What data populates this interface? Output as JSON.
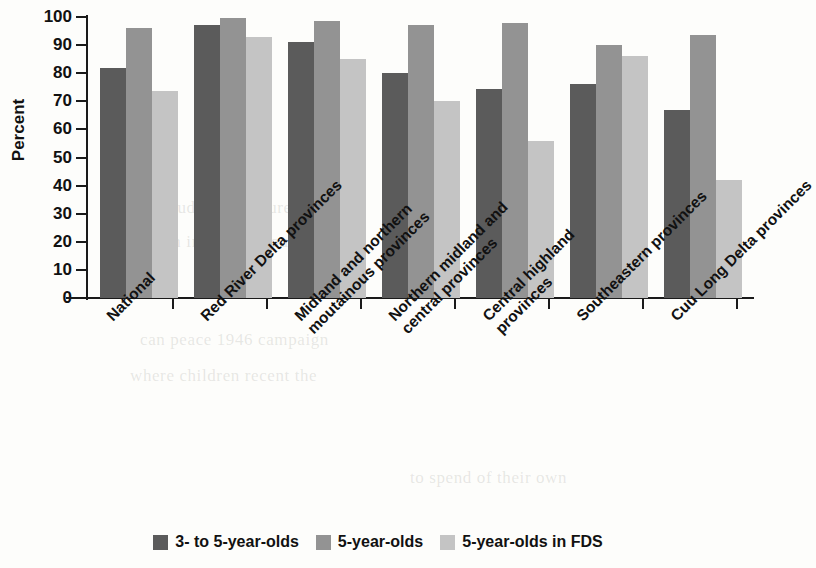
{
  "chart_data": {
    "type": "bar",
    "title": "",
    "xlabel": "",
    "ylabel": "Percent",
    "ylim": [
      0,
      100
    ],
    "yticks": [
      0,
      10,
      20,
      30,
      40,
      50,
      60,
      70,
      80,
      90,
      100
    ],
    "grid": false,
    "legend_position": "bottom",
    "categories": [
      "National",
      "Red River Delta provinces",
      "Midland and northern moutainous provinces",
      "Northern midland and central provinces",
      "Central highland provinces",
      "Southeastern provinces",
      "Cuu Long Delta provinces"
    ],
    "category_lines": [
      [
        "National",
        ""
      ],
      [
        "Red River Delta provinces",
        ""
      ],
      [
        "Midland and northern",
        "moutainous provinces"
      ],
      [
        "Northern midland and",
        "central provinces"
      ],
      [
        "Central highland",
        "provinces"
      ],
      [
        "Southeastern provinces",
        ""
      ],
      [
        "Cuu Long Delta provinces",
        ""
      ]
    ],
    "series": [
      {
        "name": "3- to 5-year-olds",
        "color": "#5b5b5b",
        "values": [
          82,
          97,
          91,
          80,
          74.5,
          76,
          67
        ]
      },
      {
        "name": "5-year-olds",
        "color": "#939393",
        "values": [
          96,
          99.5,
          98.5,
          97,
          98,
          90,
          93.5
        ]
      },
      {
        "name": "5-year-olds in FDS",
        "color": "#c4c4c4",
        "values": [
          73.5,
          93,
          85,
          70,
          56,
          86,
          42
        ]
      }
    ]
  },
  "legend": {
    "items": [
      {
        "label": "3- to 5-year-olds",
        "color": "#5b5b5b"
      },
      {
        "label": "5-year-olds",
        "color": "#939393"
      },
      {
        "label": "5-year-olds in FDS",
        "color": "#c4c4c4"
      }
    ]
  },
  "bleed_through": [
    "of  sudden  structures  to",
    "decision in  the  time  out",
    "can    peace  1946  campaign",
    "where  children  recent   the",
    "to    spend    of   their  own"
  ]
}
